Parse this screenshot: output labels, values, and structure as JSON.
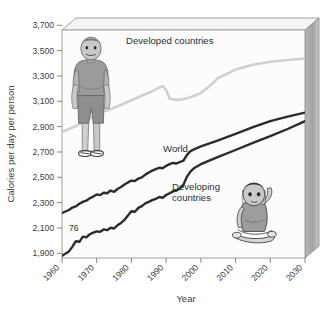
{
  "chart_data": {
    "type": "line",
    "title": "",
    "xlabel": "Year",
    "ylabel": "Calories per day per person",
    "xlim": [
      1960,
      2030
    ],
    "ylim": [
      1900,
      3800
    ],
    "xticks": [
      "1960",
      "1970",
      "1980",
      "1990",
      "2000",
      "2010",
      "2020",
      "2030"
    ],
    "yticks": [
      "1,900",
      "2,100",
      "2,300",
      "2,500",
      "2,700",
      "2,900",
      "3,100",
      "3,300",
      "3,500",
      "3,700"
    ],
    "grid": false,
    "legend_position": "inline-annotations",
    "annotations": [
      {
        "name": "point-76",
        "text": "76",
        "x": 1966,
        "y": 2120
      }
    ],
    "series": [
      {
        "name": "Developed countries",
        "color": "#d0d0d0",
        "label_x": 1978,
        "label_y": 3495,
        "x": [
          1960,
          1962,
          1964,
          1966,
          1968,
          1970,
          1972,
          1974,
          1976,
          1978,
          1980,
          1982,
          1984,
          1986,
          1988,
          1989,
          1990,
          1991,
          1992,
          1994,
          1996,
          1998,
          2000,
          2002,
          2005,
          2010,
          2015,
          2020,
          2025,
          2030
        ],
        "values": [
          2950,
          2975,
          3000,
          3030,
          3065,
          3095,
          3120,
          3140,
          3165,
          3190,
          3215,
          3240,
          3265,
          3290,
          3320,
          3332,
          3300,
          3230,
          3222,
          3218,
          3232,
          3250,
          3275,
          3320,
          3400,
          3470,
          3510,
          3535,
          3550,
          3562
        ]
      },
      {
        "name": "World",
        "color": "#2b2b2b",
        "label_x": 1994,
        "label_y": 2860,
        "x": [
          1960,
          1962,
          1963,
          1964,
          1965,
          1966,
          1967,
          1968,
          1969,
          1970,
          1971,
          1972,
          1973,
          1974,
          1975,
          1976,
          1977,
          1978,
          1979,
          1980,
          1981,
          1982,
          1983,
          1984,
          1985,
          1986,
          1987,
          1988,
          1989,
          1990,
          1991,
          1992,
          1993,
          1994,
          1995,
          1996,
          1997,
          1998,
          2000,
          2005,
          2010,
          2015,
          2020,
          2025,
          2030
        ],
        "values": [
          2275,
          2300,
          2320,
          2330,
          2352,
          2368,
          2378,
          2398,
          2412,
          2430,
          2424,
          2444,
          2440,
          2462,
          2452,
          2475,
          2492,
          2512,
          2530,
          2545,
          2542,
          2562,
          2572,
          2595,
          2612,
          2628,
          2640,
          2652,
          2648,
          2668,
          2682,
          2692,
          2688,
          2700,
          2712,
          2760,
          2790,
          2805,
          2830,
          2880,
          2935,
          2990,
          3040,
          3078,
          3112
        ]
      },
      {
        "name": "Developing countries",
        "color": "#2b2b2b",
        "label_x": 1997,
        "label_y": 2575,
        "x": [
          1960,
          1962,
          1963,
          1964,
          1965,
          1966,
          1967,
          1968,
          1969,
          1970,
          1971,
          1972,
          1973,
          1974,
          1975,
          1976,
          1977,
          1978,
          1979,
          1980,
          1981,
          1982,
          1983,
          1984,
          1985,
          1986,
          1987,
          1988,
          1989,
          1990,
          1991,
          1992,
          1993,
          1994,
          1995,
          1996,
          1997,
          1998,
          2000,
          2005,
          2010,
          2015,
          2020,
          2025,
          2030
        ],
        "values": [
          1918,
          1955,
          1995,
          2040,
          2035,
          2078,
          2072,
          2098,
          2112,
          2122,
          2118,
          2138,
          2132,
          2152,
          2146,
          2172,
          2192,
          2218,
          2255,
          2290,
          2285,
          2318,
          2332,
          2355,
          2368,
          2382,
          2392,
          2408,
          2402,
          2425,
          2440,
          2455,
          2462,
          2480,
          2512,
          2578,
          2620,
          2648,
          2682,
          2742,
          2800,
          2860,
          2915,
          2975,
          3040
        ]
      }
    ]
  },
  "figures": [
    {
      "name": "overweight-man-illustration",
      "alt": "Overweight man standing"
    },
    {
      "name": "malnourished-child-illustration",
      "alt": "Malnourished child sitting"
    }
  ],
  "colors": {
    "developed_line": "#d0d0d0",
    "dark_line": "#2b2b2b",
    "frame": "#9a9a9a",
    "panel_right": "#a8a8a8",
    "panel_top": "#efefef",
    "plot_bg": "#fbfbfb",
    "text": "#3d3d3d"
  }
}
